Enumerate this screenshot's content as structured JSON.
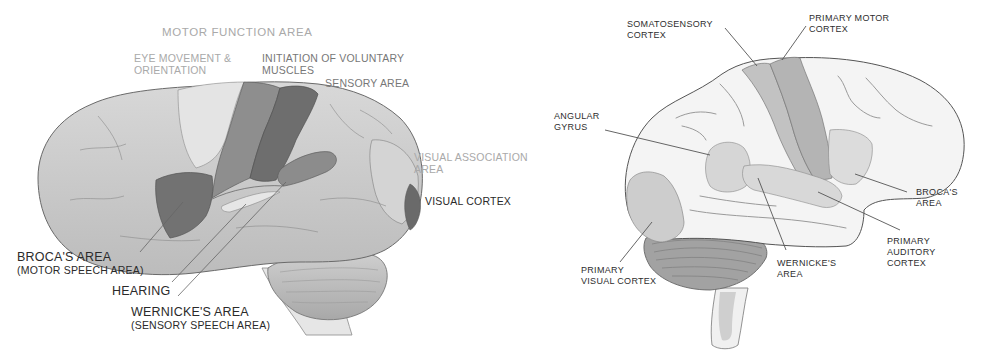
{
  "left_diagram": {
    "title": "Lateral view of brain — functional areas",
    "labels": {
      "motor_function": "MOTOR FUNCTION AREA",
      "eye_movement": [
        "EYE MOVEMENT &",
        "ORIENTATION"
      ],
      "voluntary_muscles": [
        "INITIATION OF VOLUNTARY",
        "MUSCLES"
      ],
      "sensory_area": "SENSORY AREA",
      "visual_association": [
        "VISUAL ASSOCIATION",
        "AREA"
      ],
      "visual_cortex": "VISUAL CORTEX",
      "broca": [
        "BROCA'S AREA",
        "(MOTOR SPEECH AREA)"
      ],
      "hearing": "HEARING",
      "wernicke": [
        "WERNICKE'S AREA",
        "(SENSORY SPEECH AREA)"
      ]
    }
  },
  "right_diagram": {
    "title": "Lateral view of brain — cortical regions",
    "labels": {
      "somatosensory": [
        "SOMATOSENSORY",
        "CORTEX"
      ],
      "primary_motor": [
        "PRIMARY MOTOR",
        "CORTEX"
      ],
      "angular_gyrus": [
        "ANGULAR",
        "GYRUS"
      ],
      "broca": [
        "BROCA'S",
        "AREA"
      ],
      "primary_auditory": [
        "PRIMARY",
        "AUDITORY",
        "CORTEX"
      ],
      "wernicke": [
        "WERNICKE'S",
        "AREA"
      ],
      "primary_visual": [
        "PRIMARY",
        "VISUAL CORTEX"
      ]
    }
  },
  "colors": {
    "background": "#ffffff",
    "brain_base": "#c9c9c9",
    "brain_light": "#dedede",
    "region_dark": "#6e6e6e",
    "region_mid": "#8e8e8e",
    "outline": "#555555",
    "faint_label": "#a9a9a9"
  }
}
